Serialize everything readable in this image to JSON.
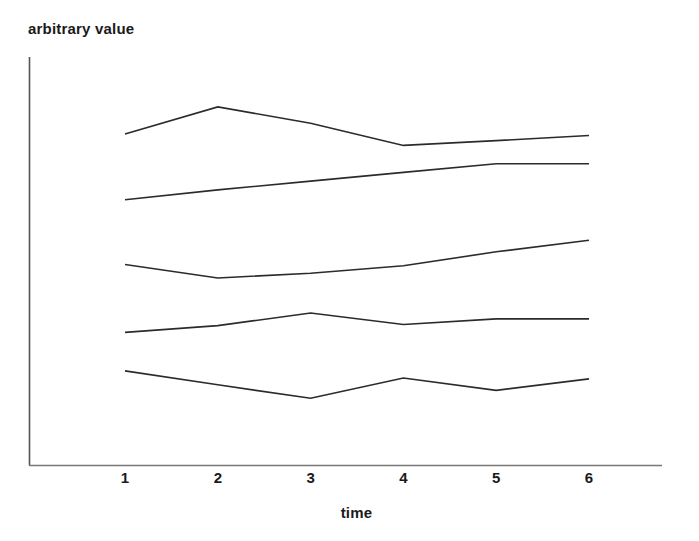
{
  "chart_data": {
    "type": "line",
    "title": "",
    "xlabel": "time",
    "ylabel": "arbitrary value",
    "x": [
      1,
      2,
      3,
      4,
      5,
      6
    ],
    "categories": [
      "1",
      "2",
      "3",
      "4",
      "5",
      "6"
    ],
    "xtick_labels": [
      "1",
      "2",
      "3",
      "4",
      "5",
      "6"
    ],
    "ytick_labels": [],
    "xlim": [
      1,
      6
    ],
    "ylim": [
      0,
      100
    ],
    "grid": false,
    "legend": null,
    "legend_position": "none",
    "axis_color": "#4d4d4d",
    "line_color": "#2b2b2b",
    "line_width": 1.6,
    "markers": false,
    "series": [
      {
        "name": "series-1",
        "values": [
          83.4,
          90.2,
          86.1,
          80.5,
          81.7,
          83.0
        ]
      },
      {
        "name": "series-2",
        "values": [
          66.8,
          69.3,
          71.5,
          73.7,
          75.9,
          75.9
        ]
      },
      {
        "name": "series-3",
        "values": [
          50.5,
          47.1,
          48.3,
          50.2,
          53.7,
          56.6
        ]
      },
      {
        "name": "series-4",
        "values": [
          33.4,
          35.1,
          38.3,
          35.4,
          36.8,
          36.8
        ]
      },
      {
        "name": "series-5",
        "values": [
          23.7,
          20.2,
          16.8,
          21.9,
          18.8,
          21.7
        ]
      }
    ]
  }
}
